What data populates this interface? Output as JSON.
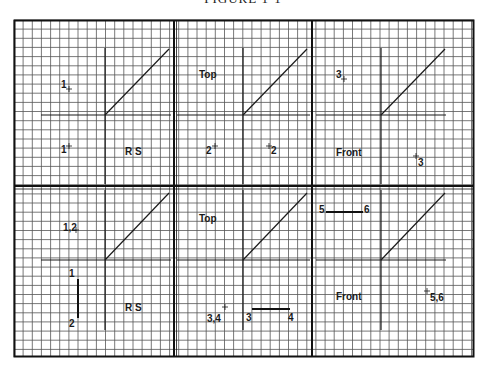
{
  "figure": {
    "title": "FIGURE 1-1"
  },
  "grid": {
    "cell_size_px": 9.15,
    "line_color": "#555555",
    "border_color": "#111111"
  },
  "panels": [
    {
      "id": "p1",
      "view_label": "R S",
      "annotations": [
        {
          "text": "1",
          "role": "point-label",
          "near": "upper-left quadrant"
        },
        {
          "text": "1",
          "role": "point-label",
          "near": "lower-left quadrant"
        }
      ]
    },
    {
      "id": "p2",
      "view_label": "Top",
      "annotations": [
        {
          "text": "2",
          "role": "point-label",
          "near": "lower-left quadrant"
        },
        {
          "text": "2",
          "role": "point-label",
          "near": "lower-right quadrant"
        }
      ]
    },
    {
      "id": "p3",
      "view_label": "Front",
      "annotations": [
        {
          "text": "3",
          "role": "point-label",
          "near": "upper-left quadrant"
        },
        {
          "text": "3",
          "role": "point-label",
          "near": "lower-right quadrant"
        }
      ]
    },
    {
      "id": "p4",
      "view_label": "R S",
      "annotations": [
        {
          "text": "1,2",
          "role": "point-label",
          "near": "upper-left quadrant"
        },
        {
          "text": "1",
          "role": "line-end-label"
        },
        {
          "text": "2",
          "role": "line-end-label"
        }
      ]
    },
    {
      "id": "p5",
      "view_label": "Top",
      "annotations": [
        {
          "text": "3,4",
          "role": "point-label",
          "near": "lower-left quadrant"
        },
        {
          "text": "3",
          "role": "line-end-label"
        },
        {
          "text": "4",
          "role": "line-end-label"
        }
      ]
    },
    {
      "id": "p6",
      "view_label": "Front",
      "annotations": [
        {
          "text": "5",
          "role": "line-end-label"
        },
        {
          "text": "6",
          "role": "line-end-label"
        },
        {
          "text": "5,6",
          "role": "point-label",
          "near": "lower-right quadrant"
        }
      ]
    }
  ]
}
